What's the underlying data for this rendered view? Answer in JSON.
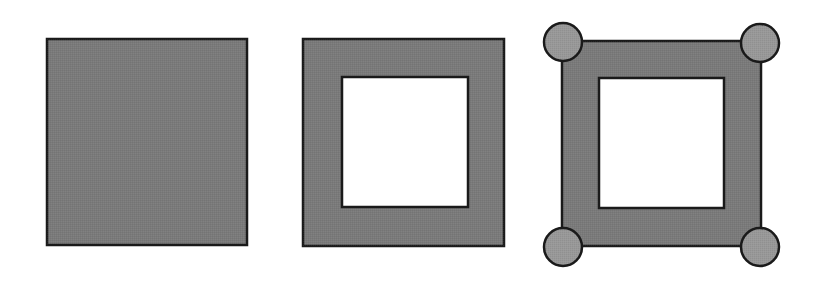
{
  "diagram": {
    "title": "",
    "colors": {
      "background": "#ffffff",
      "square_fill": "#7a7a7a",
      "hole_fill": "#ffffff",
      "circle_fill": "#989898",
      "stroke": "#1a1a1a"
    },
    "stroke_width": 2.5,
    "shapes": [
      {
        "id": "solid-square",
        "type": "square",
        "outer": {
          "x": 47,
          "y": 39,
          "w": 200,
          "h": 206
        },
        "hole": null,
        "corner_circles": []
      },
      {
        "id": "hollow-square",
        "type": "square-with-hole",
        "outer": {
          "x": 303,
          "y": 39,
          "w": 201,
          "h": 207
        },
        "hole": {
          "x": 342,
          "y": 77,
          "w": 126,
          "h": 130
        },
        "corner_circles": []
      },
      {
        "id": "hollow-square-with-corner-circles",
        "type": "square-with-hole-and-circles",
        "outer": {
          "x": 562,
          "y": 41,
          "w": 199,
          "h": 205
        },
        "hole": {
          "x": 599,
          "y": 78,
          "w": 125,
          "h": 130
        },
        "corner_circles": [
          {
            "position": "top-left",
            "cx": 563,
            "cy": 42,
            "r": 19
          },
          {
            "position": "top-right",
            "cx": 760,
            "cy": 43,
            "r": 19
          },
          {
            "position": "bottom-left",
            "cx": 563,
            "cy": 247,
            "r": 19
          },
          {
            "position": "bottom-right",
            "cx": 760,
            "cy": 247,
            "r": 19
          }
        ]
      }
    ]
  }
}
